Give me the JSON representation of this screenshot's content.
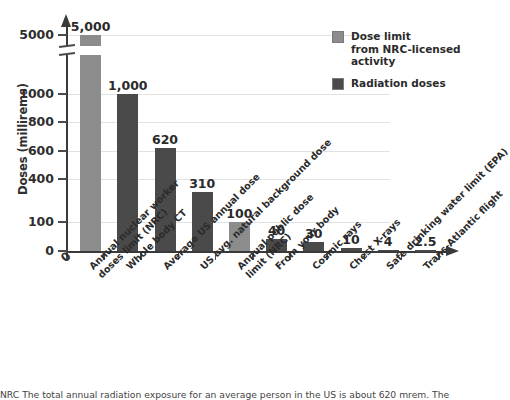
{
  "chart_data": {
    "type": "bar",
    "title": "",
    "xlabel": "",
    "ylabel": "Doses (millirems)",
    "ytick_labels": [
      "0",
      "100",
      "400",
      "600",
      "800",
      "1000",
      "5000"
    ],
    "ytick_values": [
      0,
      100,
      400,
      600,
      800,
      1000,
      5000
    ],
    "axis_break": "between 1000 and 5000",
    "grid": true,
    "legend_position": "top-right",
    "categories": [
      "Annual nuclear worker doses limit (NRC)",
      "Whole body CT",
      "Average US annual dose",
      "US avg. natural background dose",
      "Annual public dose limit (NRC)",
      "From your body",
      "Cosmic rays",
      "Chest X-rays",
      "Safe drinking water limit (EPA)",
      "Trans-Atlantic flight"
    ],
    "category_lines": [
      [
        "Annual nuclear worker",
        "doses limit (NRC)"
      ],
      [
        "Whole body CT"
      ],
      [
        "Average US annual dose"
      ],
      [
        "US avg. natural background dose"
      ],
      [
        "Annual public dose",
        "limit (NRC)"
      ],
      [
        "From your body"
      ],
      [
        "Cosmic rays"
      ],
      [
        "Chest X-rays"
      ],
      [
        "Safe drinking water limit (EPA)"
      ],
      [
        "Trans-Atlantic flight"
      ]
    ],
    "values": [
      5000,
      1000,
      620,
      310,
      100,
      40,
      30,
      10,
      4,
      2.5
    ],
    "value_labels": [
      "5,000",
      "1,000",
      "620",
      "310",
      "100",
      "40",
      "30",
      "10",
      "4",
      "2.5"
    ],
    "series_of_bar": [
      "dose-limit",
      "radiation-dose",
      "radiation-dose",
      "radiation-dose",
      "dose-limit",
      "radiation-dose",
      "radiation-dose",
      "radiation-dose",
      "radiation-dose",
      "radiation-dose"
    ],
    "origin_label": "0"
  },
  "legend": {
    "entries": [
      {
        "key": "dose-limit",
        "lines": [
          "Dose limit",
          "from NRC-licensed",
          "activity"
        ],
        "color": "#8c8c8c"
      },
      {
        "key": "radiation-dose",
        "lines": [
          "Radiation doses"
        ],
        "color": "#4a4a4a"
      }
    ]
  },
  "colors": {
    "dose_limit": "#8c8c8c",
    "radiation_dose": "#4a4a4a",
    "axis": "#3a3a3a",
    "grid": "#e2e2e2",
    "text": "#2b2b2b",
    "background": "#ffffff"
  },
  "caption": {
    "text": "NRC  The total annual radiation exposure for an average person in the US is about 620 mrem.  The"
  }
}
